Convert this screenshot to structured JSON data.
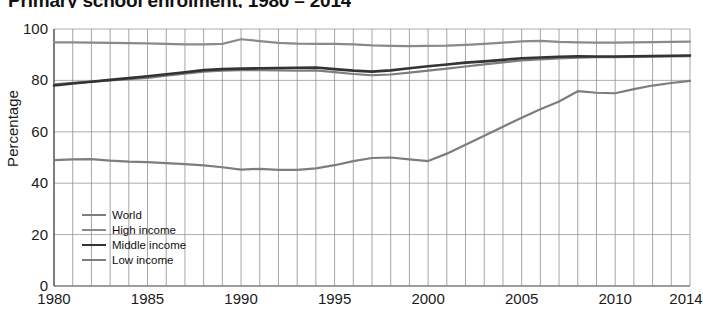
{
  "chart_data": {
    "type": "line",
    "title": "Primary school enrolment, 1980 – 2014",
    "xlabel": "",
    "ylabel": "Percentage",
    "ylim": [
      0,
      100
    ],
    "xlim": [
      1980,
      2014
    ],
    "yticks": [
      0,
      20,
      40,
      60,
      80,
      100
    ],
    "xticks": [
      1980,
      1985,
      1990,
      1995,
      2000,
      2005,
      2010,
      2014
    ],
    "grid": true,
    "legend_position": "lower left",
    "x": [
      1980,
      1981,
      1982,
      1983,
      1984,
      1985,
      1986,
      1987,
      1988,
      1989,
      1990,
      1991,
      1992,
      1993,
      1994,
      1995,
      1996,
      1997,
      1998,
      1999,
      2000,
      2001,
      2002,
      2003,
      2004,
      2005,
      2006,
      2007,
      2008,
      2009,
      2010,
      2011,
      2012,
      2013,
      2014
    ],
    "series": [
      {
        "name": "World",
        "color": "#7d7d7d",
        "width": 2.2,
        "values": [
          78.5,
          79.0,
          79.5,
          80.0,
          80.5,
          81.0,
          81.8,
          82.6,
          83.4,
          83.8,
          84.0,
          84.0,
          83.9,
          83.8,
          83.9,
          83.2,
          82.5,
          82.0,
          82.3,
          83.0,
          83.8,
          84.6,
          85.4,
          86.2,
          87.0,
          87.8,
          88.2,
          88.6,
          88.9,
          89.0,
          89.0,
          89.1,
          89.2,
          89.3,
          89.4
        ]
      },
      {
        "name": "High income",
        "color": "#8a8a8a",
        "width": 2.2,
        "values": [
          94.8,
          94.8,
          94.7,
          94.6,
          94.5,
          94.4,
          94.2,
          94.0,
          94.0,
          94.2,
          96.0,
          95.3,
          94.6,
          94.3,
          94.2,
          94.2,
          94.0,
          93.6,
          93.4,
          93.3,
          93.4,
          93.5,
          93.8,
          94.2,
          94.7,
          95.2,
          95.4,
          95.0,
          94.8,
          94.7,
          94.7,
          94.8,
          94.9,
          95.0,
          95.1
        ]
      },
      {
        "name": "Middle income",
        "color": "#333333",
        "width": 2.6,
        "values": [
          78.0,
          78.8,
          79.5,
          80.2,
          80.9,
          81.6,
          82.4,
          83.2,
          84.0,
          84.4,
          84.6,
          84.7,
          84.8,
          84.9,
          85.0,
          84.4,
          83.8,
          83.4,
          83.9,
          84.7,
          85.5,
          86.2,
          86.9,
          87.4,
          88.0,
          88.6,
          88.9,
          89.2,
          89.4,
          89.3,
          89.3,
          89.4,
          89.5,
          89.6,
          89.7
        ]
      },
      {
        "name": "Low income",
        "color": "#7d7d7d",
        "width": 2.2,
        "values": [
          49.0,
          49.3,
          49.4,
          48.8,
          48.4,
          48.2,
          47.8,
          47.4,
          46.9,
          46.2,
          45.3,
          45.6,
          45.2,
          45.2,
          45.8,
          47.0,
          48.6,
          49.8,
          50.0,
          49.3,
          48.6,
          51.5,
          55.0,
          58.5,
          62.0,
          65.5,
          68.8,
          71.8,
          75.8,
          75.2,
          75.0,
          76.6,
          78.0,
          79.0,
          79.8
        ]
      }
    ]
  }
}
